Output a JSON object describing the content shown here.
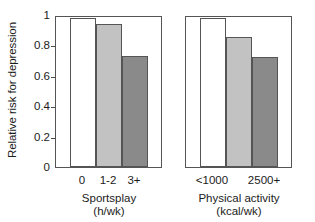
{
  "chart_data": {
    "type": "bar",
    "title": "",
    "subtitle": "",
    "xlabel": "",
    "ylabel": "Relative risk for depression",
    "ylim": [
      0,
      1
    ],
    "yticks": [
      0,
      0.2,
      0.4,
      0.6,
      0.8,
      1
    ],
    "ytick_labels": [
      "0",
      "0.2",
      "0.4",
      "0.6",
      "0.8",
      "1"
    ],
    "grid": false,
    "legend": "none",
    "panels": [
      {
        "name": "sportsplay-panel",
        "caption_line1": "Sportsplay",
        "caption_line2": "(h/wk)",
        "categories": [
          "0",
          "1-2",
          "3+"
        ],
        "values": [
          1.0,
          0.96,
          0.745
        ],
        "colors": [
          "#ffffff",
          "#c2c2c2",
          "#8a8a8a"
        ]
      },
      {
        "name": "physical-activity-panel",
        "caption_line1": "Physical activity",
        "caption_line2": "(kcal/wk)",
        "categories": [
          "<1000",
          "",
          "2500+"
        ],
        "values": [
          1.0,
          0.87,
          0.74
        ],
        "colors": [
          "#ffffff",
          "#c2c2c2",
          "#8a8a8a"
        ]
      }
    ],
    "colors": {
      "bar_white": "#ffffff",
      "bar_light_gray": "#c2c2c2",
      "bar_dark_gray": "#8a8a8a",
      "outline": "#555555",
      "text": "#1b1b1b",
      "background": "#ffffff"
    }
  }
}
